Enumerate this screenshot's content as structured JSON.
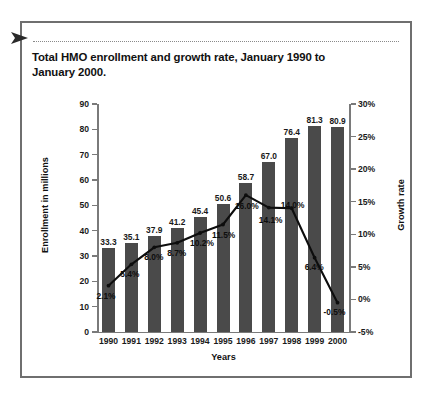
{
  "frame": {
    "arrow_icon": "right-pointing-triangle-marker",
    "separator": "dotted-rule"
  },
  "chart_data": {
    "type": "bar",
    "title": "Total HMO enrollment and growth rate, January 1990 to January 2000.",
    "xlabel": "Years",
    "ylabel": "Enrollment in millions",
    "y2label": "Growth rate",
    "categories": [
      "1990",
      "1991",
      "1992",
      "1993",
      "1994",
      "1995",
      "1996",
      "1997",
      "1998",
      "1999",
      "2000"
    ],
    "series": [
      {
        "name": "Enrollment in millions",
        "type": "bar",
        "axis": "left",
        "values": [
          33.3,
          35.1,
          37.9,
          41.2,
          45.4,
          50.6,
          58.7,
          67.0,
          76.4,
          81.3,
          80.9
        ],
        "labels": [
          "33.3",
          "35.1",
          "37.9",
          "41.2",
          "45.4",
          "50.6",
          "58.7",
          "67.0",
          "76.4",
          "81.3",
          "80.9"
        ],
        "color": "#4a4a4a"
      },
      {
        "name": "Growth rate",
        "type": "line",
        "axis": "right",
        "values": [
          2.1,
          5.4,
          8.0,
          8.7,
          10.2,
          11.5,
          16.0,
          14.1,
          14.0,
          6.4,
          -0.5
        ],
        "labels": [
          "2.1%",
          "5.4%",
          "8.0%",
          "8.7%",
          "10.2%",
          "11.5%",
          "16.0%",
          "14.1%",
          "14.0%",
          "6.4%",
          "-0.5%"
        ],
        "color": "#0d0d0d"
      }
    ],
    "ylim": [
      0,
      90
    ],
    "yticks": [
      "0",
      "10",
      "20",
      "30",
      "40",
      "50",
      "60",
      "70",
      "80",
      "90"
    ],
    "y2lim": [
      -5,
      30
    ],
    "y2ticks": [
      "-5%",
      "0%",
      "5%",
      "10%",
      "15%",
      "20%",
      "25%",
      "30%"
    ],
    "grid": false,
    "legend": "none"
  }
}
